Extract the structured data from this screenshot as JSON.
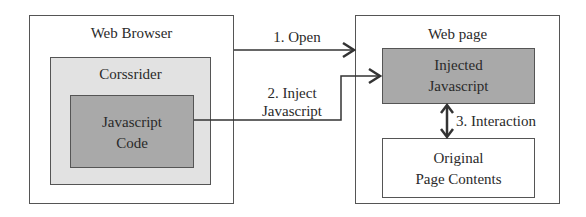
{
  "diagram": {
    "colors": {
      "outline": "#555555",
      "light_fill": "#e2e2e2",
      "dark_fill": "#a9a9a9",
      "background": "#ffffff"
    },
    "browser": {
      "title": "Web Browser",
      "extension": {
        "title": "Corssrider",
        "code": {
          "line1": "Javascript",
          "line2": "Code"
        }
      }
    },
    "webpage": {
      "title": "Web page",
      "injected": {
        "line1": "Injected",
        "line2": "Javascript"
      },
      "original": {
        "line1": "Original",
        "line2": "Page Contents"
      }
    },
    "arrows": {
      "open": "1. Open",
      "inject_line1": "2. Inject",
      "inject_line2": "Javascript",
      "interaction": "3. Interaction"
    }
  }
}
